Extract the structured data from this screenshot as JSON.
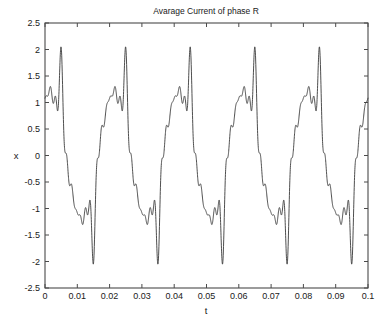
{
  "chart_data": {
    "type": "line",
    "title": "Avarage Current of phase R",
    "xlabel": "t",
    "ylabel": "x",
    "xlim": [
      0,
      0.1
    ],
    "ylim": [
      -2.5,
      2.5
    ],
    "xticks": [
      0,
      0.01,
      0.02,
      0.03,
      0.04,
      0.05,
      0.06,
      0.07,
      0.08,
      0.09,
      0.1
    ],
    "xticklabels": [
      "0",
      "0.01",
      "0.02",
      "0.03",
      "0.04",
      "0.05",
      "0.06",
      "0.07",
      "0.08",
      "0.09",
      "0.1"
    ],
    "yticks": [
      -2.5,
      -2,
      -1.5,
      -1,
      -0.5,
      0,
      0.5,
      1,
      1.5,
      2,
      2.5
    ],
    "yticklabels": [
      "-2.5",
      "-2",
      "-1.5",
      "-1",
      "-0.5",
      "0",
      "0.5",
      "1",
      "1.5",
      "2",
      "2.5"
    ],
    "grid": false,
    "legend": false,
    "line_color": "#3a3a3a",
    "series": [
      {
        "name": "phase R current",
        "fundamental_hz": 50,
        "period_s": 0.02,
        "cycles": 5,
        "peak_value": 2.05,
        "trough_value": -2.05,
        "shoulder_high": 1.25,
        "shoulder_notch": 0.82,
        "shoulder_low": -1.25,
        "shoulder_notch_neg": -0.82,
        "start_value": 1.0,
        "x": [
          0,
          0.1
        ],
        "waveform_harmonics": [
          {
            "n": 1,
            "amp": 1.32,
            "phase_deg": 52
          },
          {
            "n": 3,
            "amp": 0.3,
            "phase_deg": 180
          },
          {
            "n": 5,
            "amp": 0.26,
            "phase_deg": 0
          },
          {
            "n": 7,
            "amp": 0.2,
            "phase_deg": 180
          },
          {
            "n": 9,
            "amp": 0.12,
            "phase_deg": 0
          },
          {
            "n": 11,
            "amp": 0.16,
            "phase_deg": 180
          },
          {
            "n": 13,
            "amp": 0.11,
            "phase_deg": 0
          }
        ],
        "zero_crossings": [
          0.0108,
          0.02,
          0.0308,
          0.04,
          0.0508,
          0.06,
          0.0708,
          0.08,
          0.0908,
          0.1
        ]
      }
    ]
  },
  "plot_box": {
    "left_px": 45,
    "right_px": 368,
    "top_px": 23,
    "bottom_px": 288
  }
}
